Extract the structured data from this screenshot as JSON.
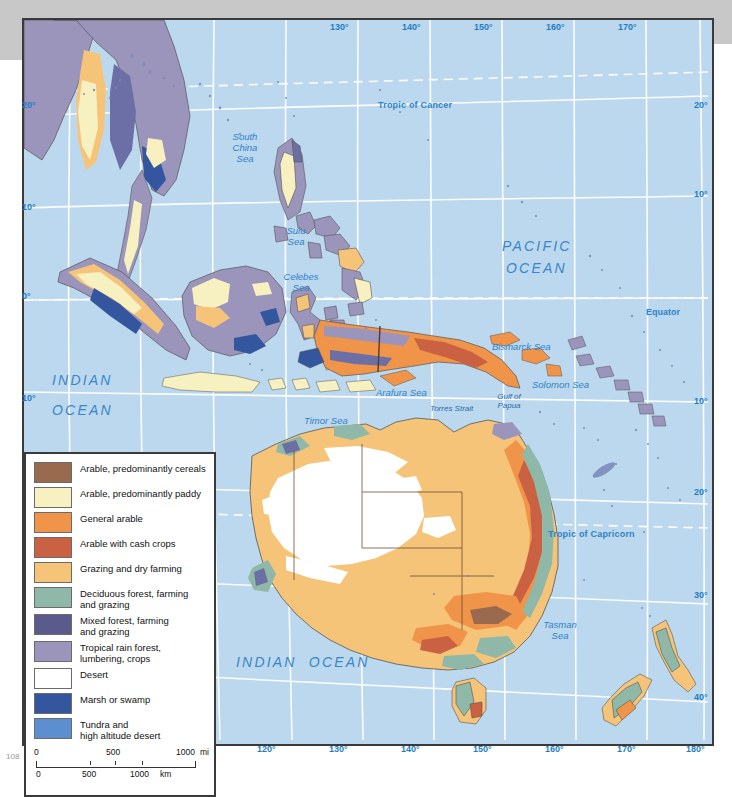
{
  "map": {
    "title": "Land Use — Southeast Asia, Australia and Oceania",
    "ocean_color": "#bcd8ee",
    "graticule_color": "#ffffff",
    "label_color": "#2f82c6",
    "oceans": [
      {
        "name": "pacific-ocean",
        "line1": "PACIFIC",
        "line2": "OCEAN"
      },
      {
        "name": "indian-ocean-north",
        "line1": "INDIAN",
        "line2": "OCEAN"
      },
      {
        "name": "indian-ocean-south",
        "line1": "INDIAN  OCEAN",
        "line2": ""
      }
    ],
    "seas": [
      {
        "name": "south-china-sea",
        "text": "South\nChina\nSea"
      },
      {
        "name": "sulu-sea",
        "text": "Sulu\nSea"
      },
      {
        "name": "celebes-sea",
        "text": "Celebes\nSea"
      },
      {
        "name": "arafura-sea",
        "text": "Arafura Sea"
      },
      {
        "name": "bismarck-sea",
        "text": "Bismarck Sea"
      },
      {
        "name": "solomon-sea",
        "text": "Solomon Sea"
      },
      {
        "name": "timor-sea",
        "text": "Timor Sea"
      },
      {
        "name": "tasman-sea",
        "text": "Tasman\nSea"
      },
      {
        "name": "gulf-of-papua",
        "text": "Gulf of\nPapua"
      },
      {
        "name": "torres-strait",
        "text": "Torres Strait"
      }
    ],
    "reference_lines": [
      {
        "name": "tropic-of-cancer",
        "label": "Tropic of Cancer"
      },
      {
        "name": "equator",
        "label": "Equator"
      },
      {
        "name": "tropic-of-capricorn",
        "label": "Tropic of Capricorn"
      }
    ],
    "longitude_labels": [
      "90°",
      "100°",
      "110°",
      "120°",
      "130°",
      "140°",
      "150°",
      "160°",
      "170°",
      "180°"
    ],
    "longitude_labels_top": [
      "130°",
      "140°",
      "150°",
      "160°",
      "170°"
    ],
    "latitude_labels_left": [
      "20°",
      "10°",
      "0°",
      "10°"
    ],
    "latitude_labels_right": [
      "20°",
      "10°",
      "10°",
      "20°",
      "30°",
      "40°"
    ],
    "page_marker": "108"
  },
  "legend": {
    "title": "Land use",
    "items": [
      {
        "label": "Arable, predominantly cereals",
        "color": "#9a6a4e"
      },
      {
        "label": "Arable, predominantly paddy",
        "color": "#f7f0c0"
      },
      {
        "label": "General arable",
        "color": "#f0944a"
      },
      {
        "label": "Arable with cash crops",
        "color": "#ca6143"
      },
      {
        "label": "Grazing and dry farming",
        "color": "#f5c478"
      },
      {
        "label": "Deciduous forest, farming\nand grazing",
        "color": "#8fb8a8"
      },
      {
        "label": "Mixed forest, farming\nand grazing",
        "color": "#5a5a8c"
      },
      {
        "label": "Tropical rain forest,\nlumbering, crops",
        "color": "#9b94bb"
      },
      {
        "label": "Desert",
        "color": "#ffffff"
      },
      {
        "label": "Marsh or swamp",
        "color": "#33569e"
      },
      {
        "label": "Tundra and\nhigh altitude desert",
        "color": "#5b8fd0"
      }
    ],
    "scale": {
      "miles": {
        "ticks": [
          "0",
          "500",
          "1000"
        ],
        "unit": "mi"
      },
      "km": {
        "ticks": [
          "0",
          "500",
          "1000"
        ],
        "unit": "km"
      }
    }
  }
}
